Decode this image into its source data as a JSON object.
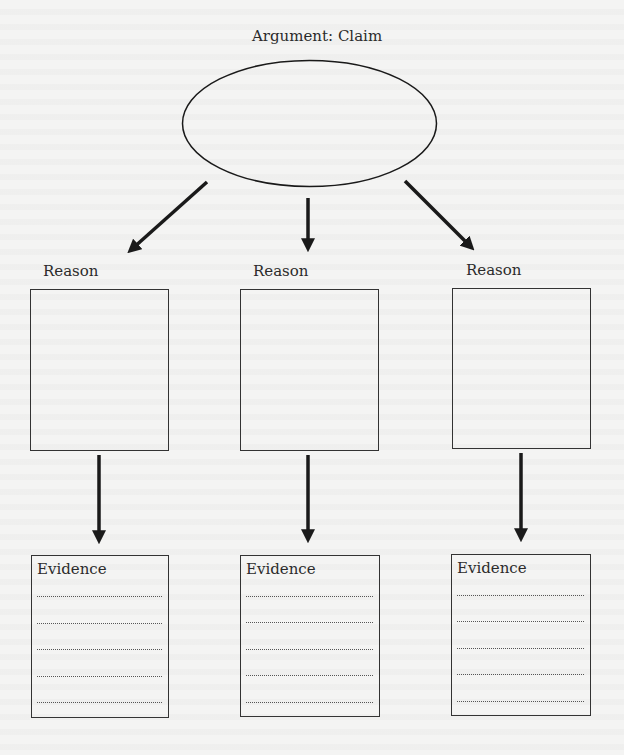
{
  "diagram": {
    "title": "Argument: Claim",
    "claim_shape": "ellipse",
    "reasons": [
      {
        "label": "Reason",
        "evidence": {
          "label": "Evidence",
          "lines": 5
        }
      },
      {
        "label": "Reason",
        "evidence": {
          "label": "Evidence",
          "lines": 5
        }
      },
      {
        "label": "Reason",
        "evidence": {
          "label": "Evidence",
          "lines": 5
        }
      }
    ],
    "colors": {
      "background": "#f4f4f3",
      "stroke": "#1a1a1a",
      "text": "#2b2b2b"
    }
  }
}
